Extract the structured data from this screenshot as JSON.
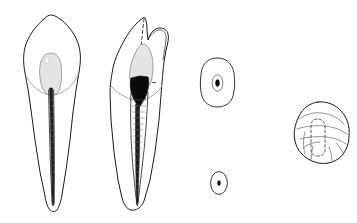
{
  "figure": {
    "illustration_type": "line drawing, dental anatomy plate",
    "background_color": "#ffffff",
    "ink_color": "#1a1a1a",
    "pulp_shade_color": "#e4e4e4",
    "pulp_solid_color": "#0a0a0a",
    "label_text": "",
    "panels": [
      {
        "id": "panel-1",
        "name": "buccolingual-longitudinal-section",
        "view": "Buccal (labial) longitudinal section",
        "caption": "",
        "features": [
          "single pointed buccal cusp crown outline",
          "ovoid light-gray pulp chamber in crown",
          "faint cervical line (CEJ) crossing the neck",
          "long tapering single root",
          "narrow dark root canal running to apex"
        ],
        "pulp_chamber_shade": "light gray",
        "canal_count": 1
      },
      {
        "id": "panel-2",
        "name": "mesiodistal-proximal-section",
        "view": "Proximal (mesial) longitudinal section",
        "caption": "",
        "features": [
          "tall buccal cusp with smaller lingual cusp",
          "dashed hidden contour of buccal ridge",
          "gray occlusal pulp horn area",
          "solid black pulp chamber",
          "tapering root canal with fine hatching",
          "rounded root apex"
        ],
        "pulp_chamber_shade": "black",
        "canal_count": 1
      },
      {
        "id": "panel-3",
        "name": "root-cross-section-cervical",
        "view": "Root cross-section, cervical third",
        "caption": "",
        "features": [
          "rounded squarish root outline",
          "central oval canal outline",
          "small solid black canal lumen"
        ],
        "canal_count": 1
      },
      {
        "id": "panel-4",
        "name": "root-cross-section-apical",
        "view": "Root cross-section, apical third",
        "caption": "",
        "features": [
          "small oval root outline",
          "tiny solid black canal lumen"
        ],
        "canal_count": 1
      },
      {
        "id": "panel-5",
        "name": "occlusal-view",
        "view": "Occlusal view",
        "caption": "",
        "features": [
          "rounded diamond crown outline",
          "transverse ridge and marginal ridge lines",
          "developmental grooves",
          "dashed rectangular outline of pulp chamber"
        ],
        "canal_count": 1
      }
    ]
  }
}
